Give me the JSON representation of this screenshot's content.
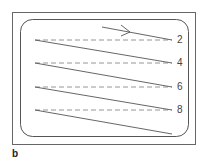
{
  "figure": {
    "panel_label": "b",
    "colors": {
      "frame": "#666666",
      "solid_line": "#555555",
      "dashed_line": "#8a8a8a",
      "label": "#444444"
    },
    "scan_lines": [
      {
        "label": "2"
      },
      {
        "label": "4"
      },
      {
        "label": "6"
      },
      {
        "label": "8"
      }
    ],
    "direction_arrow": "right-arrow"
  }
}
